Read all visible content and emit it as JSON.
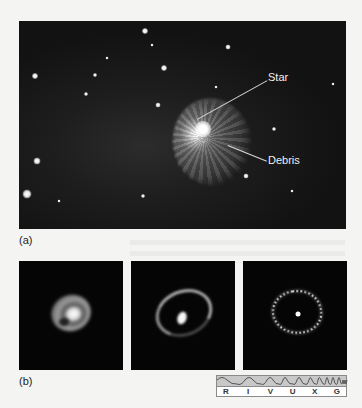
{
  "figure_a": {
    "panel_label": "(a)",
    "annotations": {
      "star": "Star",
      "debris": "Debris"
    }
  },
  "figure_b": {
    "panel_label": "(b)",
    "panels": [
      {
        "name": "inner-ring-early"
      },
      {
        "name": "inner-ring-mid"
      },
      {
        "name": "inner-ring-late"
      }
    ],
    "spectrum_bar": {
      "bands": [
        "R",
        "I",
        "V",
        "U",
        "X",
        "G"
      ],
      "highlighted": "V"
    }
  }
}
